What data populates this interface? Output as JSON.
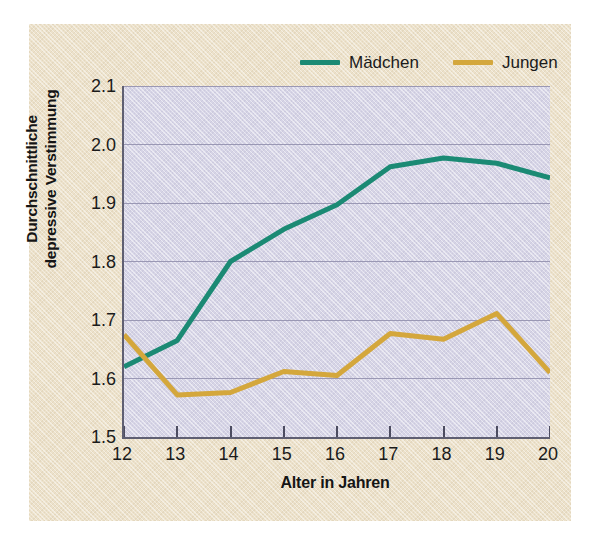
{
  "chart_data": {
    "type": "line",
    "title": "",
    "xlabel": "Alter in Jahren",
    "ylabel_line1": "Durchschnittliche",
    "ylabel_line2": "depressive Verstimmung",
    "x": [
      12,
      13,
      14,
      15,
      16,
      17,
      18,
      19,
      20
    ],
    "xtick_labels": [
      "12",
      "13",
      "14",
      "15",
      "16",
      "17",
      "18",
      "19",
      "20"
    ],
    "ytick_labels": [
      "1.5",
      "1.6",
      "1.7",
      "1.8",
      "1.9",
      "2.0",
      "2.1"
    ],
    "ytick_values": [
      1.5,
      1.6,
      1.7,
      1.8,
      1.9,
      2.0,
      2.1
    ],
    "xlim": [
      12,
      20
    ],
    "ylim": [
      1.5,
      2.1
    ],
    "grid": true,
    "grid_axis": "y",
    "legend_position": "top-right",
    "series": [
      {
        "name": "Mädchen",
        "color": "#1b8a74",
        "values": [
          1.62,
          1.665,
          1.8,
          1.855,
          1.897,
          1.962,
          1.977,
          1.968,
          1.943
        ]
      },
      {
        "name": "Jungen",
        "color": "#d4a73c",
        "values": [
          1.675,
          1.572,
          1.576,
          1.612,
          1.605,
          1.677,
          1.667,
          1.711,
          1.61
        ]
      }
    ]
  },
  "legend": {
    "entries": [
      {
        "label": "Mädchen",
        "color": "#1b8a74"
      },
      {
        "label": "Jungen",
        "color": "#d4a73c"
      }
    ]
  },
  "colors": {
    "maedchen": "#1b8a74",
    "jungen": "#d4a73c",
    "plot_background": "#d6d4e6",
    "card_background": "#ece1ca",
    "axis": "#5f5f72",
    "gridline": "#9a98b4",
    "text": "#1b1b1b"
  }
}
